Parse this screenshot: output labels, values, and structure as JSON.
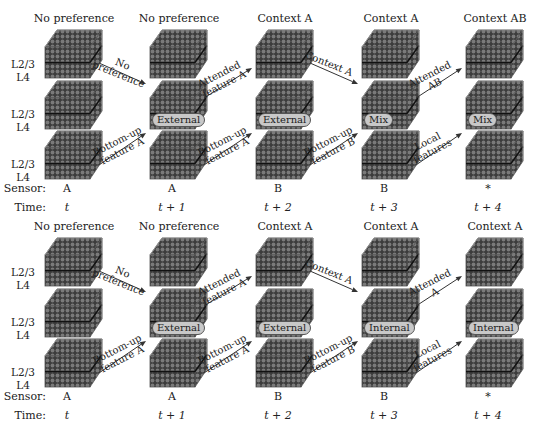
{
  "panels": [
    {
      "id": "top",
      "columns": [
        {
          "title": "No preference",
          "sensor": "A",
          "time": "t",
          "badge": ""
        },
        {
          "title": "No preference",
          "sensor": "A",
          "time": "t + 1",
          "badge": "External"
        },
        {
          "title": "Context A",
          "sensor": "B",
          "time": "t + 2",
          "badge": "External"
        },
        {
          "title": "Context A",
          "sensor": "B",
          "time": "t + 3",
          "badge": "Mix"
        },
        {
          "title": "Context AB",
          "sensor": "*",
          "time": "t + 4",
          "badge": "Mix"
        }
      ],
      "top_arrows": [
        {
          "line1": "No",
          "line2": "preference"
        },
        {
          "line1": "Attended",
          "line2": "feature A"
        },
        {
          "line1": "Context A",
          "line2": ""
        },
        {
          "line1": "Attended",
          "line2": "AB"
        }
      ],
      "bottom_arrows": [
        {
          "line1": "Bottom-up",
          "line2": "feature A"
        },
        {
          "line1": "Bottom-up",
          "line2": "feature A"
        },
        {
          "line1": "Bottom-up",
          "line2": "feature B"
        },
        {
          "line1": "Local",
          "line2": "features"
        }
      ]
    },
    {
      "id": "bottom",
      "columns": [
        {
          "title": "No preference",
          "sensor": "A",
          "time": "t",
          "badge": ""
        },
        {
          "title": "No preference",
          "sensor": "A",
          "time": "t + 1",
          "badge": "External"
        },
        {
          "title": "Context A",
          "sensor": "B",
          "time": "t + 2",
          "badge": "External"
        },
        {
          "title": "Context A",
          "sensor": "B",
          "time": "t + 3",
          "badge": "Internal"
        },
        {
          "title": "Context A",
          "sensor": "*",
          "time": "t + 4",
          "badge": "Internal"
        }
      ],
      "top_arrows": [
        {
          "line1": "No",
          "line2": "preference"
        },
        {
          "line1": "Attended",
          "line2": "feature A"
        },
        {
          "line1": "Context A",
          "line2": ""
        },
        {
          "line1": "Attended",
          "line2": "A"
        }
      ],
      "bottom_arrows": [
        {
          "line1": "Bottom-up",
          "line2": "feature A"
        },
        {
          "line1": "Bottom-up",
          "line2": "feature A"
        },
        {
          "line1": "Bottom-up",
          "line2": "feature B"
        },
        {
          "line1": "Local",
          "line2": "features"
        }
      ]
    }
  ],
  "layer_labels": {
    "upper": "L2/3",
    "lower": "L4"
  },
  "row_labels": {
    "sensor": "Sensor:",
    "time": "Time:"
  },
  "colors": {
    "block_fill": "#6a6a6a",
    "block_dark": "#3a3a3a",
    "badge_fill": "#c8c8c8",
    "arrow": "#333333"
  }
}
